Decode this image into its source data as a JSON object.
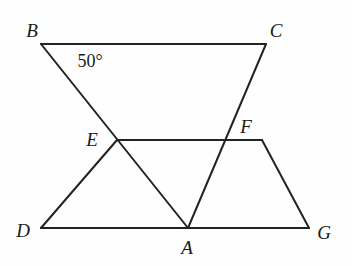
{
  "figure": {
    "stroke_color": "#232323",
    "background_color": "#fefefe",
    "stroke_width": 2,
    "canvas": {
      "width": 352,
      "height": 266
    },
    "points": {
      "B": {
        "x": 41,
        "y": 44
      },
      "C": {
        "x": 266,
        "y": 44
      },
      "E": {
        "x": 117,
        "y": 140
      },
      "F": {
        "x": 226,
        "y": 140
      },
      "D": {
        "x": 41,
        "y": 228
      },
      "A": {
        "x": 188,
        "y": 228
      },
      "G": {
        "x": 309,
        "y": 228
      },
      "H": {
        "x": 262,
        "y": 140
      }
    },
    "segments": [
      {
        "name": "segment-BC",
        "from": "B",
        "to": "C"
      },
      {
        "name": "segment-BA",
        "from": "B",
        "to": "A"
      },
      {
        "name": "segment-CA",
        "from": "C",
        "to": "A"
      },
      {
        "name": "segment-EH",
        "from": "E",
        "to": "H"
      },
      {
        "name": "segment-ED",
        "from": "E",
        "to": "D"
      },
      {
        "name": "segment-DG",
        "from": "D",
        "to": "G"
      },
      {
        "name": "segment-HG",
        "from": "H",
        "to": "G"
      }
    ],
    "vertex_labels": [
      {
        "key": "B",
        "text": "B",
        "x": 32,
        "y": 30
      },
      {
        "key": "C",
        "text": "C",
        "x": 276,
        "y": 30
      },
      {
        "key": "E",
        "text": "E",
        "x": 92,
        "y": 139
      },
      {
        "key": "F",
        "text": "F",
        "x": 246,
        "y": 126
      },
      {
        "key": "D",
        "text": "D",
        "x": 23,
        "y": 230
      },
      {
        "key": "A",
        "text": "A",
        "x": 187,
        "y": 247
      },
      {
        "key": "G",
        "text": "G",
        "x": 324,
        "y": 232
      }
    ],
    "angle_labels": [
      {
        "key": "angle-B",
        "text": "50°",
        "x": 90,
        "y": 61
      }
    ]
  }
}
